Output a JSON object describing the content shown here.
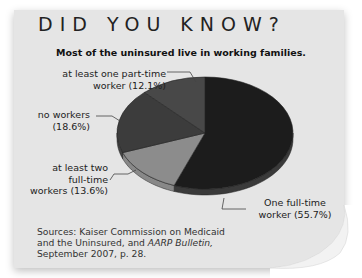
{
  "header": {
    "title": "DID YOU KNOW?"
  },
  "chart_data": {
    "type": "pie",
    "title": "Most of the uninsured live in working families.",
    "slices": [
      {
        "label": "One full-time worker",
        "value": 55.7,
        "color": "#1c1c1c"
      },
      {
        "label": "at least two full-time workers",
        "value": 13.6,
        "color": "#8c8c8c"
      },
      {
        "label": "no workers",
        "value": 18.6,
        "color": "#3c3c3c"
      },
      {
        "label": "at least one part-time worker",
        "value": 12.1,
        "color": "#484848"
      }
    ],
    "labels": {
      "part_time_line1": "at least one part-time",
      "part_time_line2": "worker (12.1%)",
      "no_workers_line1": "no workers",
      "no_workers_line2": "(18.6%)",
      "two_ft_line1": "at least two",
      "two_ft_line2": "full-time",
      "two_ft_line3": "workers (13.6%)",
      "one_ft_line1": "One full-time",
      "one_ft_line2": "worker (55.7%)"
    }
  },
  "footer": {
    "sources_line1": "Sources: Kaiser Commission on Medicaid",
    "sources_line2_prefix": "and the Uninsured, and ",
    "sources_line2_italic": "AARP Bulletin,",
    "sources_line3": "September 2007, p. 28."
  }
}
